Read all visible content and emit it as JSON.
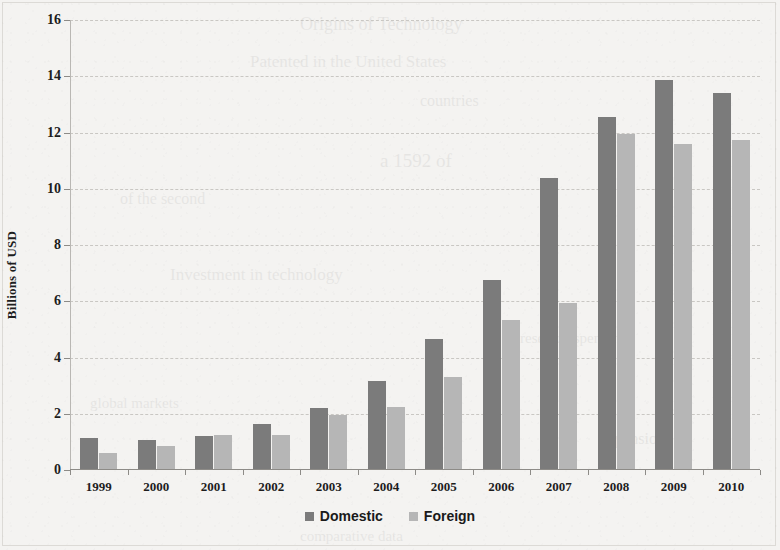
{
  "chart_data": {
    "type": "bar",
    "title": "",
    "subtitle": "",
    "xlabel": "",
    "ylabel": "Billions of USD",
    "categories": [
      "1999",
      "2000",
      "2001",
      "2002",
      "2003",
      "2004",
      "2005",
      "2006",
      "2007",
      "2008",
      "2009",
      "2010"
    ],
    "series": [
      {
        "name": "Domestic",
        "color": "#7b7b7b",
        "values": [
          1.15,
          1.05,
          1.2,
          1.65,
          2.2,
          3.15,
          4.65,
          6.75,
          10.4,
          12.55,
          13.85,
          13.4
        ]
      },
      {
        "name": "Foreign",
        "color": "#b6b6b6",
        "values": [
          0.6,
          0.85,
          1.25,
          1.25,
          1.95,
          2.25,
          3.3,
          5.35,
          5.95,
          11.95,
          11.6,
          11.75
        ]
      }
    ],
    "ylim": [
      0,
      16
    ],
    "ytick_step": 2,
    "yticks": [
      "16",
      "14",
      "12",
      "10",
      "8",
      "6",
      "4",
      "2",
      "0"
    ],
    "grid": true,
    "grid_axis": "y",
    "legend_position": "bottom"
  },
  "ghost_text": [
    {
      "text": "Origins of Technology",
      "x": 300,
      "y": 14,
      "size": 18
    },
    {
      "text": "Patented in the United States",
      "x": 250,
      "y": 52,
      "size": 17
    },
    {
      "text": "countries",
      "x": 420,
      "y": 92,
      "size": 16
    },
    {
      "text": "a 1592 of",
      "x": 380,
      "y": 150,
      "size": 19
    },
    {
      "text": "Investment in technology",
      "x": 170,
      "y": 265,
      "size": 17
    },
    {
      "text": "of the second",
      "x": 120,
      "y": 190,
      "size": 16
    },
    {
      "text": "research spending",
      "x": 520,
      "y": 330,
      "size": 15
    },
    {
      "text": "global markets",
      "x": 90,
      "y": 395,
      "size": 15
    },
    {
      "text": "expansion",
      "x": 600,
      "y": 430,
      "size": 16
    },
    {
      "text": "comparative data",
      "x": 300,
      "y": 528,
      "size": 15
    }
  ]
}
